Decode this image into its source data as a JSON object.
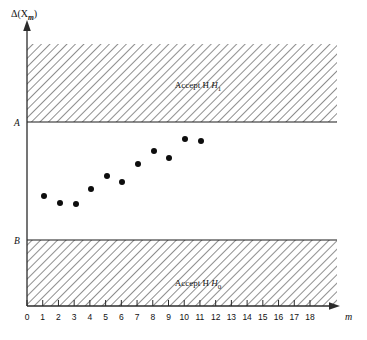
{
  "chart_data": {
    "type": "scatter",
    "title": "",
    "ylabel": "Δ(X",
    "ylabel_sub": "m",
    "ylabel_close": ")",
    "xlabel": "m",
    "xlim": [
      0,
      18
    ],
    "xticks": [
      0,
      1,
      2,
      3,
      4,
      5,
      6,
      7,
      8,
      9,
      10,
      11,
      12,
      13,
      14,
      15,
      16,
      17,
      18
    ],
    "xticklabels": [
      "0",
      "1",
      "2",
      "3",
      "4",
      "5",
      "6",
      "7",
      "8",
      "9",
      "10",
      "11",
      "12",
      "13",
      "14",
      "15",
      "16",
      "17",
      "18"
    ],
    "grid": false,
    "legend_position": "none",
    "boundaries": [
      {
        "name": "A",
        "label": "A",
        "y_px": 122.0,
        "role": "upper-decision-boundary"
      },
      {
        "name": "B",
        "label": "B",
        "y_px": 240.0,
        "role": "lower-decision-boundary"
      }
    ],
    "regions": [
      {
        "label": "Accept H",
        "sub": "1",
        "zone": "above-A",
        "hatched": true,
        "label_x_px": 198,
        "label_y_px": 85
      },
      {
        "label": "Accept H",
        "sub": "0",
        "zone": "below-B",
        "hatched": true,
        "label_x_px": 198,
        "label_y_px": 283
      }
    ],
    "series": [
      {
        "name": "Δ(X_m) observations",
        "marker": "filled-circle",
        "x": [
          1,
          2,
          3,
          4,
          5,
          6,
          7,
          8,
          9,
          10,
          11
        ],
        "y_px": [
          196,
          203,
          204,
          189,
          176,
          182,
          164,
          151,
          158,
          139,
          141
        ],
        "points_px": [
          {
            "m": 1,
            "x_px": 44,
            "y_px": 196
          },
          {
            "m": 2,
            "x_px": 60,
            "y_px": 203
          },
          {
            "m": 3,
            "x_px": 76,
            "y_px": 204
          },
          {
            "m": 4,
            "x_px": 91,
            "y_px": 189
          },
          {
            "m": 5,
            "x_px": 107,
            "y_px": 176
          },
          {
            "m": 6,
            "x_px": 122,
            "y_px": 182
          },
          {
            "m": 7,
            "x_px": 138,
            "y_px": 164
          },
          {
            "m": 8,
            "x_px": 154,
            "y_px": 151
          },
          {
            "m": 9,
            "x_px": 169,
            "y_px": 158
          },
          {
            "m": 10,
            "x_px": 185,
            "y_px": 139
          },
          {
            "m": 11,
            "x_px": 201,
            "y_px": 141
          }
        ]
      }
    ],
    "colors": {
      "axis": "#2b2b2b",
      "marker": "#0d0d0d",
      "hatch": "#3a3a3a",
      "background": "#ffffff"
    }
  }
}
